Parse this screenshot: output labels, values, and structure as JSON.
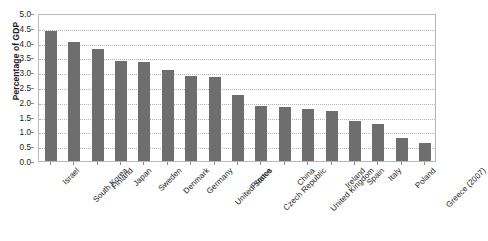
{
  "chart_data": {
    "type": "bar",
    "title": "",
    "subtitle": "",
    "xlabel": "",
    "ylabel": "Percentage of GDP",
    "ylim": [
      0.0,
      5.0
    ],
    "ytick_step": 0.5,
    "ytick_labels": [
      "0.0",
      "0.5",
      "1.0",
      "1.5",
      "2.0",
      "2.5",
      "3.0",
      "3.5",
      "4.0",
      "4.5",
      "5.0"
    ],
    "grid": true,
    "grid_style": "dotted-horizontal",
    "legend": false,
    "legend_position": "none",
    "bar_color": "#6e6e6e",
    "frame_color": "#b9b9b9",
    "categories": [
      "Israel",
      "South Korea",
      "Finland",
      "Japan",
      "Sweden",
      "Denmark",
      "Germany",
      "United States",
      "France",
      "Czech Republic",
      "China",
      "United Kingdom",
      "Ireland",
      "Spain",
      "Italy",
      "Poland",
      "Greece (2007)"
    ],
    "values": [
      4.38,
      4.01,
      3.77,
      3.39,
      3.36,
      3.08,
      2.87,
      2.84,
      2.24,
      1.85,
      1.84,
      1.77,
      1.7,
      1.34,
      1.26,
      0.77,
      0.61
    ]
  }
}
